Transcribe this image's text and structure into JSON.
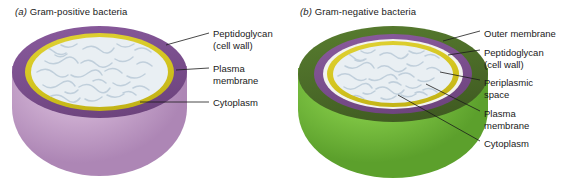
{
  "figure": {
    "background_color": "#ffffff"
  },
  "panels": [
    {
      "id": "a",
      "marker": "(a)",
      "title": "Gram-positive bacteria",
      "cell": {
        "name": "gram-positive-cell",
        "exterior_color": "#c9a8cd",
        "layers": [
          {
            "name": "peptidoglycan-cell-wall",
            "color": "#7b4f8e"
          },
          {
            "name": "plasma-membrane",
            "color": "#d4c51f"
          },
          {
            "name": "cytoplasm",
            "color": "#e8eef2"
          }
        ]
      },
      "labels": [
        {
          "name": "label-peptidoglycan",
          "line1": "Peptidoglycan",
          "line2": "(cell wall)"
        },
        {
          "name": "label-plasma-membrane",
          "line1": "Plasma",
          "line2": "membrane"
        },
        {
          "name": "label-cytoplasm",
          "line1": "Cytoplasm",
          "line2": ""
        }
      ]
    },
    {
      "id": "b",
      "marker": "(b)",
      "title": "Gram-negative bacteria",
      "cell": {
        "name": "gram-negative-cell",
        "exterior_color": "#7cc242",
        "layers": [
          {
            "name": "outer-membrane",
            "color": "#4b6b28"
          },
          {
            "name": "peptidoglycan-cell-wall",
            "color": "#7b4f8e"
          },
          {
            "name": "periplasmic-space",
            "color": "#f2f2ee"
          },
          {
            "name": "plasma-membrane",
            "color": "#d4c51f"
          },
          {
            "name": "cytoplasm",
            "color": "#e8eef2"
          }
        ]
      },
      "labels": [
        {
          "name": "label-outer-membrane",
          "line1": "Outer membrane",
          "line2": ""
        },
        {
          "name": "label-peptidoglycan",
          "line1": "Peptidoglycan",
          "line2": "(cell wall)"
        },
        {
          "name": "label-periplasmic-space",
          "line1": "Periplasmic",
          "line2": "space"
        },
        {
          "name": "label-plasma-membrane",
          "line1": "Plasma",
          "line2": "membrane"
        },
        {
          "name": "label-cytoplasm",
          "line1": "Cytoplasm",
          "line2": ""
        }
      ]
    }
  ]
}
